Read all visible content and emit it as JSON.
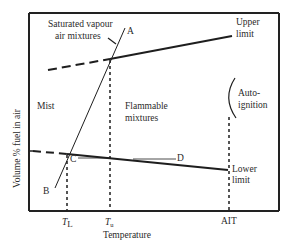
{
  "diagram": {
    "type": "flammability-temperature-diagram",
    "axes": {
      "x_label": "Temperature",
      "y_label": "Volume % fuel in air",
      "x_ticks": [
        {
          "main": "T",
          "sub": "L"
        },
        {
          "main": "T",
          "sub": "u"
        },
        {
          "main": "AIT",
          "sub": ""
        }
      ]
    },
    "regions": {
      "mist": "Mist",
      "flammable_line1": "Flammable",
      "flammable_line2": "mixtures",
      "saturated_line1": "Saturated vapour",
      "saturated_line2": "air mixtures",
      "autoignition_line1": "Auto-",
      "autoignition_line2": "ignition"
    },
    "curves": {
      "upper_limit_line1": "Upper",
      "upper_limit_line2": "limit",
      "lower_limit_line1": "Lower",
      "lower_limit_line2": "limit"
    },
    "points": {
      "a": "A",
      "b": "B",
      "c": "C",
      "d": "D"
    },
    "colors": {
      "line": "#1e1e1e",
      "frame": "#222222",
      "text": "#2a2a2a"
    }
  }
}
